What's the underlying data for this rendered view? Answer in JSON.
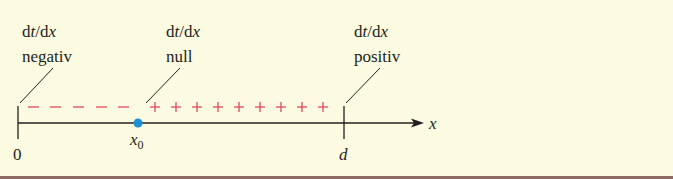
{
  "labels": {
    "negative": {
      "line1_d1": "d",
      "line1_t": "t",
      "line1_sep": "/d",
      "line1_x": "x",
      "line2": "negativ"
    },
    "zero": {
      "line1_d1": "d",
      "line1_t": "t",
      "line1_sep": "/d",
      "line1_x": "x",
      "line2": "null"
    },
    "positive": {
      "line1_d1": "d",
      "line1_t": "t",
      "line1_sep": "/d",
      "line1_x": "x",
      "line2": "positiv"
    }
  },
  "axis": {
    "var_label": "x",
    "tick_start": "0",
    "tick_end": "d",
    "point_label": "x",
    "point_sub": "0"
  },
  "signs": {
    "minus": [
      "−",
      "−",
      "−",
      "−",
      "−"
    ],
    "plus": [
      "+",
      "+",
      "+",
      "+",
      "+",
      "+",
      "+",
      "+",
      "+"
    ]
  },
  "colors": {
    "background": "#fcfae0",
    "sign": "#e04a5e",
    "point": "#1e90d8",
    "axis": "#231f20",
    "rule": "#8a6a62"
  }
}
